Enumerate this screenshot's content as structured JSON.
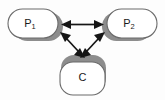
{
  "diagram": {
    "type": "node-link-diagram",
    "background_color": "#fdfdfd",
    "node_fill_color": "#ffffff",
    "node_stroke_color": "#6b6b6b",
    "node_shadow_color": "#8d8d8d",
    "arrow_color": "#151515",
    "nodes": [
      {
        "id": "p1",
        "label_main": "P",
        "label_sub": "1",
        "shadow_side": "right",
        "x": 8,
        "y": 9,
        "width": 50,
        "height": 29
      },
      {
        "id": "p2",
        "label_main": "P",
        "label_sub": "2",
        "shadow_side": "left",
        "x": 107,
        "y": 9,
        "width": 50,
        "height": 29
      },
      {
        "id": "c",
        "label_main": "C",
        "label_sub": "",
        "shadow_side": "top",
        "x": 60,
        "y": 58,
        "width": 45,
        "height": 37
      }
    ],
    "edges": [
      {
        "id": "p1-p2",
        "from": "p1",
        "to": "p2",
        "direction": "bidirectional",
        "style": "straight-horizontal"
      },
      {
        "id": "p1-c",
        "from": "p1",
        "to": "c",
        "direction": "bidirectional",
        "style": "straight-diagonal"
      },
      {
        "id": "p2-c",
        "from": "p2",
        "to": "c",
        "direction": "bidirectional",
        "style": "straight-diagonal"
      }
    ]
  }
}
